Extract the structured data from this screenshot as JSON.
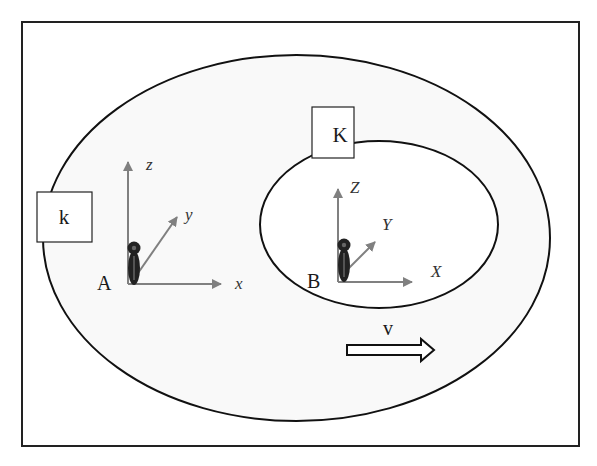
{
  "diagram": {
    "type": "reference-frames",
    "colors": {
      "frame_stroke": "#222222",
      "ellipse_stroke": "#111111",
      "ring_fill": "#f9f9f9",
      "inner_fill": "#ffffff",
      "axis_color": "#808080",
      "figure_color": "#222222",
      "figure_highlight": "#666666"
    },
    "outer_region": {
      "box_label": "k",
      "observer": {
        "label": "A",
        "axes": {
          "x": "x",
          "y": "y",
          "z": "z"
        }
      }
    },
    "inner_region": {
      "box_label": "K",
      "observer": {
        "label": "B",
        "axes": {
          "x": "X",
          "y": "Y",
          "z": "Z"
        }
      }
    },
    "velocity": {
      "label": "v",
      "direction": "right"
    }
  }
}
